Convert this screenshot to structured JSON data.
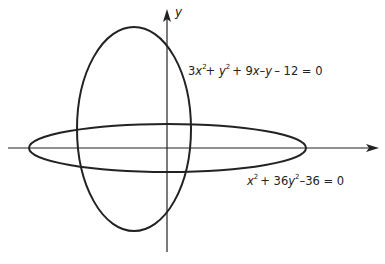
{
  "diagram": {
    "axes": {
      "x_label": "",
      "y_label": "y"
    },
    "curves": [
      {
        "id": "ellipse-vertical",
        "equation_parts": {
          "a": "3",
          "x": "x",
          "exp1": "2",
          "plus1": "+ ",
          "y": "y",
          "exp2": "2",
          "rest": "+ 9",
          "x2": "x",
          "minus": "–",
          "y2": "y",
          "tail": "– 12 = 0"
        },
        "equation": "3x² + y² + 9x – y – 12 = 0"
      },
      {
        "id": "ellipse-horizontal",
        "equation_parts": {
          "x": "x",
          "exp1": "2",
          "mid": "+ 36",
          "y": "y",
          "exp2": "2",
          "tail": "–36 = 0"
        },
        "equation": "x² + 36y² – 36 = 0"
      }
    ],
    "colors": {
      "stroke": "#222222",
      "background": "#ffffff"
    }
  }
}
